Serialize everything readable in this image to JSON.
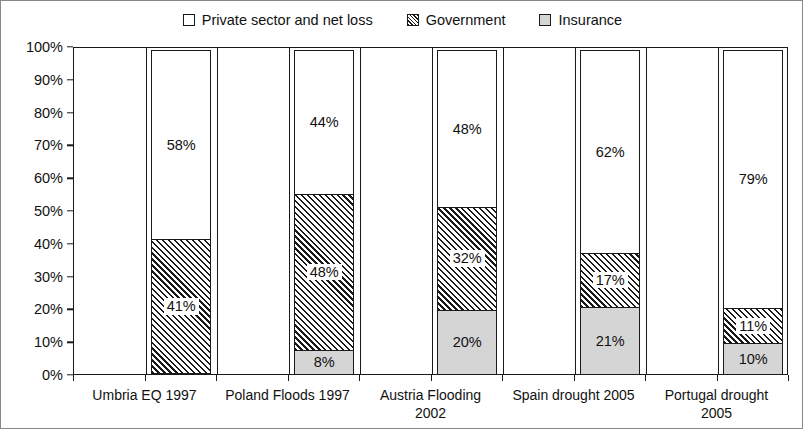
{
  "chart_data": {
    "type": "bar",
    "variant": "stacked-100-percent",
    "title": "",
    "subtitle": "",
    "xlabel": "",
    "ylabel": "",
    "ylim": [
      0,
      100
    ],
    "ytick_labels": [
      "0%",
      "10%",
      "20%",
      "30%",
      "40%",
      "50%",
      "60%",
      "70%",
      "80%",
      "90%",
      "100%"
    ],
    "ytick_values": [
      0,
      10,
      20,
      30,
      40,
      50,
      60,
      70,
      80,
      90,
      100
    ],
    "grid": false,
    "legend_position": "top-center",
    "categories": [
      "Umbria EQ 1997",
      "Poland Floods 1997",
      "Austria Flooding 2002",
      "Spain drought 2005",
      "Portugal drought 2005"
    ],
    "series": [
      {
        "name": "Private sector and net loss",
        "fill": "white",
        "color": "#ffffff",
        "values": [
          58,
          44,
          48,
          62,
          79
        ],
        "labels": [
          "58%",
          "44%",
          "48%",
          "62%",
          "79%"
        ]
      },
      {
        "name": "Government",
        "fill": "diagonal-hatch",
        "color": "#1a1a1a",
        "values": [
          41,
          48,
          32,
          17,
          11
        ],
        "labels": [
          "41%",
          "48%",
          "32%",
          "17%",
          "11%"
        ]
      },
      {
        "name": "Insurance",
        "fill": "light-gray",
        "color": "#d5d5d5",
        "values": [
          1,
          8,
          20,
          21,
          10
        ],
        "labels": [
          "1%",
          "8%",
          "20%",
          "21%",
          "10%"
        ]
      }
    ]
  },
  "legend": {
    "items": [
      {
        "label": "Private sector and net loss",
        "swatch": "white-square-icon"
      },
      {
        "label": "Government",
        "swatch": "hatched-square-icon"
      },
      {
        "label": "Insurance",
        "swatch": "gray-square-icon"
      }
    ]
  },
  "axes": {
    "y": {
      "ticks": [
        {
          "label": "100%",
          "value": 100
        },
        {
          "label": "90%",
          "value": 90
        },
        {
          "label": "80%",
          "value": 80
        },
        {
          "label": "70%",
          "value": 70
        },
        {
          "label": "60%",
          "value": 60
        },
        {
          "label": "50%",
          "value": 50
        },
        {
          "label": "40%",
          "value": 40
        },
        {
          "label": "30%",
          "value": 30
        },
        {
          "label": "20%",
          "value": 20
        },
        {
          "label": "10%",
          "value": 10
        },
        {
          "label": "0%",
          "value": 0
        }
      ]
    },
    "x": {
      "ticks": [
        {
          "label": "Umbria EQ 1997"
        },
        {
          "label": "Poland Floods 1997"
        },
        {
          "label": "Austria Flooding\n2002"
        },
        {
          "label": "Spain drought 2005"
        },
        {
          "label": "Portugal drought\n2005"
        }
      ]
    }
  },
  "colors": {
    "ink": "#1a1a1a",
    "insurance_gray": "#d5d5d5",
    "background": "#ffffff",
    "frame": "#888888"
  }
}
